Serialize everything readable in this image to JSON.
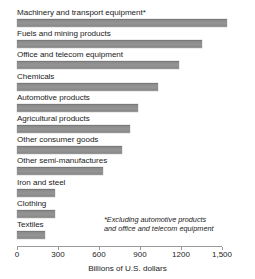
{
  "chart_data": {
    "type": "bar",
    "orientation": "horizontal",
    "title": "",
    "xlabel": "Billions of U.S. dollars",
    "ylabel": "",
    "xlim": [
      0,
      1500
    ],
    "xticks": [
      0,
      300,
      600,
      900,
      1200,
      1500
    ],
    "xticklabels": [
      "0",
      "300",
      "600",
      "900",
      "1200",
      "1,500"
    ],
    "grid": false,
    "legend": null,
    "bar_color": "#8c8c8c",
    "categories": [
      "Machinery and transport equipment*",
      "Fuels and mining products",
      "Office and telecom equipment",
      "Chemicals",
      "Automotive products",
      "Agricultural products",
      "Other consumer goods",
      "Other semi-manufactures",
      "Iron and steel",
      "Clothing",
      "Textiles"
    ],
    "values": [
      1540,
      1350,
      1185,
      1030,
      885,
      825,
      770,
      630,
      280,
      280,
      205
    ],
    "annotations": [
      "*Excluding automotive products",
      "and office and telecom equipment"
    ]
  },
  "footnote": {
    "line1": "*Excluding automotive products",
    "line2": "and office and telecom equipment"
  },
  "axis": {
    "title": "Billions of U.S. dollars"
  }
}
